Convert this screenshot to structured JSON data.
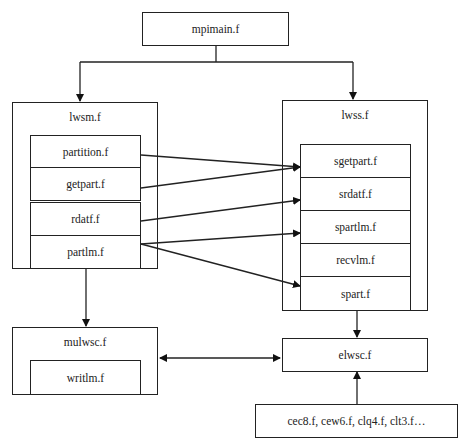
{
  "diagram": {
    "root": {
      "label": "mpimain.f"
    },
    "lwsm": {
      "label": "lwsm.f",
      "modules": [
        "partition.f",
        "getpart.f",
        "rdatf.f",
        "partlm.f"
      ]
    },
    "lwss": {
      "label": "lwss.f",
      "modules": [
        "sgetpart.f",
        "srdatf.f",
        "spartlm.f",
        "recvlm.f",
        "spart.f"
      ]
    },
    "mulwsc": {
      "label": "mulwsc.f",
      "modules": [
        "writlm.f"
      ]
    },
    "elwsc": {
      "label": "elwsc.f"
    },
    "elements": {
      "label": "cec8.f, cew6.f, clq4.f, clt3.f…"
    },
    "edges": [
      {
        "from": "mpimain.f",
        "to": "lwsm.f"
      },
      {
        "from": "mpimain.f",
        "to": "lwss.f"
      },
      {
        "from": "partition.f",
        "to": "sgetpart.f"
      },
      {
        "from": "getpart.f",
        "to": "sgetpart.f"
      },
      {
        "from": "rdatf.f",
        "to": "srdatf.f"
      },
      {
        "from": "partlm.f",
        "to": "spartlm.f"
      },
      {
        "from": "partlm.f",
        "to": "spart.f"
      },
      {
        "from": "lwsm.f",
        "to": "mulwsc.f"
      },
      {
        "from": "lwss.f",
        "to": "elwsc.f"
      },
      {
        "from": "mulwsc.f",
        "to": "elwsc.f",
        "bidirectional": true
      },
      {
        "from": "cec8.f, cew6.f, clq4.f, clt3.f…",
        "to": "elwsc.f"
      }
    ]
  }
}
